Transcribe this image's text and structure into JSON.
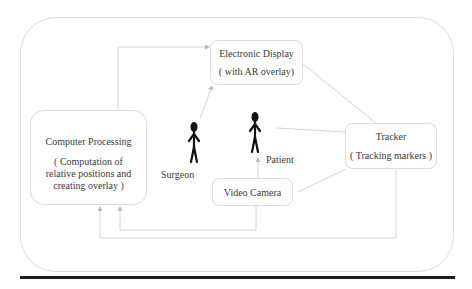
{
  "diagram": {
    "nodes": {
      "display": {
        "title": "Electronic  Display",
        "subtitle": "( with AR overlay)"
      },
      "computer_processing": {
        "title": "Computer Processing",
        "subtitle": "( Computation of relative positions and creating overlay )"
      },
      "tracker": {
        "title": "Tracker",
        "subtitle": "( Tracking markers )"
      },
      "camera": {
        "title": "Video Camera"
      }
    },
    "actors": {
      "surgeon": {
        "label": "Surgeon"
      },
      "patient": {
        "label": "Patient"
      }
    },
    "edges": [
      {
        "from": "computer_processing",
        "to": "display"
      },
      {
        "from": "surgeon",
        "to": "display"
      },
      {
        "from": "display",
        "to": "tracker"
      },
      {
        "from": "patient",
        "to": "tracker"
      },
      {
        "from": "camera",
        "to": "patient"
      },
      {
        "from": "camera",
        "to": "tracker"
      },
      {
        "from": "camera",
        "to": "computer_processing"
      },
      {
        "from": "tracker",
        "to": "computer_processing"
      }
    ],
    "colors": {
      "line": "#d4d4d4",
      "box_border": "#dedede",
      "figure": "#111111",
      "rule": "#1e1e1e"
    }
  }
}
